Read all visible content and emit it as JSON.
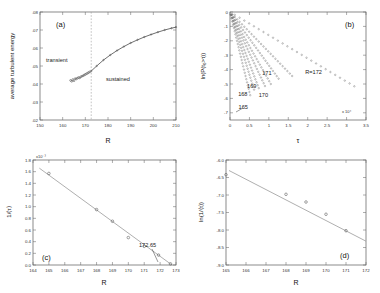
{
  "figure": {
    "panels": [
      {
        "id": "a",
        "label": "(a)",
        "xlabel": "R",
        "ylabel": "average turbulent energy",
        "xticks": [
          "150",
          "160",
          "170",
          "180",
          "190",
          "200",
          "210"
        ],
        "yticks": [
          ".02",
          ".03",
          ".04",
          ".05",
          ".06",
          ".07",
          ".08"
        ],
        "annotations": [
          "transient",
          "sustained"
        ],
        "divider_x": 172.6
      },
      {
        "id": "b",
        "label": "(b)",
        "xlabel": "τ",
        "ylabel": "ln(P(t₀>τ))",
        "xticks": [
          "0",
          "0.5",
          "1",
          "1.5",
          "2",
          "2.5",
          "3",
          "3.5"
        ],
        "yticks": [
          "0",
          "-1",
          "-2",
          "-3",
          "-4",
          "-5",
          "-6",
          "-7"
        ],
        "xexponent": "x 10⁴",
        "annotations": [
          "171",
          "R=172",
          "169",
          "168",
          "170",
          "165"
        ]
      },
      {
        "id": "c",
        "label": "(c)",
        "xlabel": "R",
        "ylabel": "1/⟨τ⟩",
        "xticks": [
          "164",
          "165",
          "166",
          "167",
          "168",
          "169",
          "170",
          "171",
          "172",
          "173"
        ],
        "yticks": [
          "0.0",
          "0.2",
          "0.4",
          "0.6",
          "0.8",
          "1.0",
          "1.2",
          "1.4",
          "1.6",
          "1.8"
        ],
        "yexponent": "x10⁻³",
        "annotations": [
          "172.65"
        ]
      },
      {
        "id": "d",
        "label": "(d)",
        "xlabel": "R",
        "ylabel": "ln(1/⟨τ⟩)",
        "xticks": [
          "165",
          "166",
          "167",
          "168",
          "169",
          "170",
          "171",
          "172"
        ],
        "yticks": [
          "-6.0",
          "-6.5",
          "-7.0",
          "-7.5",
          "-8.0",
          "-8.5",
          "-9.0"
        ],
        "annotations": []
      }
    ]
  },
  "chart_data": [
    {
      "type": "scatter",
      "panel": "a",
      "title": "(a)",
      "xlabel": "R",
      "ylabel": "average turbulent energy",
      "xlim": [
        150,
        210
      ],
      "ylim": [
        0.02,
        0.08
      ],
      "grid": false,
      "transient_points": {
        "x": [
          163.5,
          164.0,
          164.5,
          165.0,
          165.5,
          166.0,
          166.5,
          167.0,
          167.5,
          168.0,
          168.5,
          169.0,
          169.5,
          170.0,
          170.5,
          171.0,
          171.5,
          172.0
        ],
        "y": [
          0.042,
          0.0415,
          0.0425,
          0.0418,
          0.043,
          0.0428,
          0.0432,
          0.0436,
          0.0434,
          0.044,
          0.0443,
          0.0446,
          0.045,
          0.0453,
          0.0457,
          0.046,
          0.0464,
          0.0468
        ]
      },
      "sustained_curve": {
        "x": [
          172.6,
          175,
          178,
          181,
          184,
          187,
          190,
          193,
          196,
          199,
          202,
          205,
          208,
          210
        ],
        "y": [
          0.0472,
          0.05,
          0.0533,
          0.0561,
          0.0586,
          0.0608,
          0.0628,
          0.0645,
          0.0661,
          0.0675,
          0.0688,
          0.07,
          0.071,
          0.0716
        ]
      },
      "divider_x": 172.6,
      "annotations": [
        {
          "text": "transient",
          "x": 163,
          "y": 0.0595
        },
        {
          "text": "sustained",
          "x": 182,
          "y": 0.0512
        }
      ]
    },
    {
      "type": "line",
      "panel": "b",
      "title": "(b)",
      "xlabel": "τ",
      "ylabel": "ln(P(t₀>τ))",
      "xlim": [
        0,
        35000
      ],
      "ylim": [
        -7.5,
        0
      ],
      "xexponent": "x 10⁴",
      "grid": false,
      "series": [
        {
          "name": "165",
          "slope_tau": 900,
          "xmax": 5200
        },
        {
          "name": "166",
          "slope_tau": 1150,
          "xmax": 6200
        },
        {
          "name": "167",
          "slope_tau": 1400,
          "xmax": 7400
        },
        {
          "name": "168",
          "slope_tau": 1750,
          "xmax": 9000
        },
        {
          "name": "169",
          "slope_tau": 2100,
          "xmax": 10500
        },
        {
          "name": "170",
          "slope_tau": 2700,
          "xmax": 12500
        },
        {
          "name": "171",
          "slope_tau": 3600,
          "xmax": 16000
        },
        {
          "name": "R=172",
          "slope_tau": 6200,
          "xmax": 32000
        }
      ],
      "annotations": [
        {
          "text": "171",
          "x": 9500,
          "y": -4.35
        },
        {
          "text": "R=172",
          "x": 21500,
          "y": -4.3
        },
        {
          "text": "169",
          "x": 5600,
          "y": -5.3
        },
        {
          "text": "168",
          "x": 3300,
          "y": -5.85
        },
        {
          "text": "170",
          "x": 8600,
          "y": -5.9
        },
        {
          "text": "165",
          "x": 3400,
          "y": -6.75
        }
      ]
    },
    {
      "type": "scatter",
      "panel": "c",
      "title": "(c)",
      "xlabel": "R",
      "ylabel": "1/⟨τ⟩",
      "xlim": [
        164,
        173
      ],
      "ylim": [
        0.0,
        1.8
      ],
      "yexponent": "x10⁻³",
      "grid": false,
      "x": [
        165.0,
        168.0,
        169.0,
        170.0,
        171.0,
        171.9,
        172.65
      ],
      "y": [
        1.57,
        0.95,
        0.75,
        0.47,
        0.32,
        0.17,
        0.02
      ],
      "fit_line": {
        "x": [
          164.4,
          172.75
        ],
        "y": [
          1.66,
          0.0
        ]
      },
      "annotations": [
        {
          "text": "172.65",
          "x": 171.6,
          "y": 0.36
        }
      ]
    },
    {
      "type": "scatter",
      "panel": "d",
      "title": "(d)",
      "xlabel": "R",
      "ylabel": "ln(1/⟨τ⟩)",
      "xlim": [
        165,
        172
      ],
      "ylim": [
        -9.0,
        -6.0
      ],
      "grid": false,
      "x": [
        165.0,
        168.0,
        169.0,
        170.0,
        171.0
      ],
      "y": [
        -6.42,
        -6.98,
        -7.2,
        -7.55,
        -8.02
      ],
      "fit_line": {
        "x": [
          165.15,
          172.0
        ],
        "y": [
          -6.3,
          -8.32
        ]
      },
      "annotations": []
    }
  ]
}
